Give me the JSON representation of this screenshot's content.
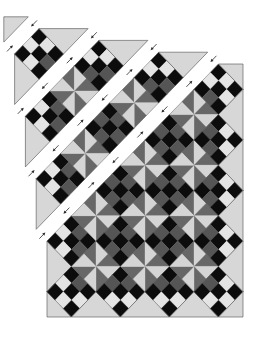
{
  "figure": {
    "kind": "quilt assembly diagram",
    "layout": "on-point blocks sewn in diagonal rows",
    "geometry": {
      "blocks_across": 4,
      "blocks_down": 5,
      "origin": [
        47,
        64
      ],
      "unit": [
        24.5,
        25.3
      ],
      "row_step": [
        -10.8,
        -11.8
      ]
    },
    "colors": {
      "background": "#ffffff",
      "setting_triangle": "#d7d7d7",
      "nine_patch_dark": "#0c0c0c",
      "nine_patch_light": "#e4e4e4",
      "nine_patch_accent": "#555555",
      "pinwheel_light": "#d5d5d5",
      "pinwheel_dark": "#676767",
      "outline": "#5a5a5a",
      "arrow": "#2a2a2a"
    },
    "pinwheel_light_triangles": [
      "N-right",
      "E-bottom",
      "S-left",
      "W-top"
    ],
    "pressing_arrows": {
      "show": true,
      "rule": "toward nine-patch",
      "icon": "arrow-icon"
    },
    "rows": [
      {
        "row": 1,
        "state": "separated",
        "offset_steps": 4,
        "arrows": false,
        "pieces": [
          [
            "corner-triangle",
            0,
            0
          ]
        ]
      },
      {
        "row": 2,
        "state": "separated",
        "offset_steps": 3,
        "arrows": true,
        "pieces": [
          [
            "setting-triangle",
            0,
            2
          ],
          [
            "nine-patch",
            1,
            1
          ],
          [
            "setting-triangle",
            2,
            0
          ]
        ]
      },
      {
        "row": 3,
        "state": "separated",
        "offset_steps": 2,
        "arrows": true,
        "pieces": [
          [
            "setting-triangle",
            0,
            4
          ],
          [
            "nine-patch",
            1,
            3
          ],
          [
            "pinwheel",
            2,
            2
          ],
          [
            "nine-patch",
            3,
            1
          ],
          [
            "setting-triangle",
            4,
            0
          ]
        ]
      },
      {
        "row": 4,
        "state": "separated",
        "offset_steps": 1,
        "arrows": true,
        "pieces": [
          [
            "setting-triangle",
            0,
            6
          ],
          [
            "nine-patch",
            1,
            5
          ],
          [
            "pinwheel",
            2,
            4
          ],
          [
            "nine-patch",
            3,
            3
          ],
          [
            "pinwheel",
            4,
            2
          ],
          [
            "nine-patch",
            5,
            1
          ],
          [
            "setting-triangle",
            6,
            0
          ]
        ]
      },
      {
        "row": 5,
        "state": "assembled",
        "offset_steps": 0,
        "arrows": true,
        "pieces": [
          [
            "setting-triangle",
            0,
            8
          ],
          [
            "nine-patch",
            1,
            7
          ],
          [
            "pinwheel",
            2,
            6
          ],
          [
            "nine-patch",
            3,
            5
          ],
          [
            "pinwheel",
            4,
            4
          ],
          [
            "nine-patch",
            5,
            3
          ],
          [
            "pinwheel",
            6,
            2
          ],
          [
            "nine-patch",
            7,
            1
          ],
          [
            "corner-triangle",
            8,
            0
          ]
        ]
      },
      {
        "row": 6,
        "state": "assembled",
        "offset_steps": 0,
        "arrows": false,
        "pieces": [
          [
            "corner-triangle",
            0,
            10
          ],
          [
            "nine-patch",
            1,
            9
          ],
          [
            "pinwheel",
            2,
            8
          ],
          [
            "nine-patch",
            3,
            7
          ],
          [
            "pinwheel",
            4,
            6
          ],
          [
            "nine-patch",
            5,
            5
          ],
          [
            "pinwheel",
            6,
            4
          ],
          [
            "nine-patch",
            7,
            3
          ],
          [
            "setting-triangle",
            8,
            2
          ]
        ]
      },
      {
        "row": 7,
        "state": "assembled",
        "offset_steps": 0,
        "arrows": false,
        "pieces": [
          [
            "setting-triangle",
            2,
            10
          ],
          [
            "nine-patch",
            3,
            9
          ],
          [
            "pinwheel",
            4,
            8
          ],
          [
            "nine-patch",
            5,
            7
          ],
          [
            "pinwheel",
            6,
            6
          ],
          [
            "nine-patch",
            7,
            5
          ],
          [
            "setting-triangle",
            8,
            4
          ]
        ]
      },
      {
        "row": 8,
        "state": "assembled",
        "offset_steps": 0,
        "arrows": false,
        "pieces": [
          [
            "setting-triangle",
            4,
            10
          ],
          [
            "nine-patch",
            5,
            9
          ],
          [
            "pinwheel",
            6,
            8
          ],
          [
            "nine-patch",
            7,
            7
          ],
          [
            "setting-triangle",
            8,
            6
          ]
        ]
      },
      {
        "row": 9,
        "state": "assembled",
        "offset_steps": 0,
        "arrows": false,
        "pieces": [
          [
            "setting-triangle",
            6,
            10
          ],
          [
            "nine-patch",
            7,
            9
          ],
          [
            "setting-triangle",
            8,
            8
          ]
        ]
      },
      {
        "row": 10,
        "state": "assembled",
        "offset_steps": 0,
        "arrows": false,
        "pieces": [
          [
            "corner-triangle",
            8,
            10
          ]
        ]
      }
    ]
  }
}
